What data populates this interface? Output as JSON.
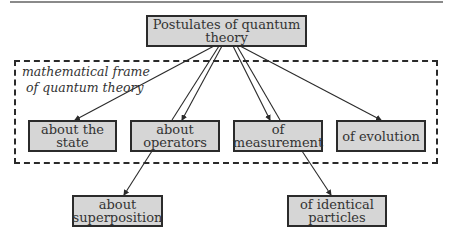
{
  "diagram": {
    "root": {
      "id": "postulates",
      "label": "Postulates of quantum theory"
    },
    "frame": {
      "label_line1": "mathematical frame",
      "label_line2": "of quantum theory",
      "style": "dashed"
    },
    "frame_nodes": [
      {
        "id": "state",
        "label": "about the state"
      },
      {
        "id": "operators",
        "label": "about operators"
      },
      {
        "id": "measurement",
        "label": "of measurement"
      },
      {
        "id": "evolution",
        "label": "of evolution"
      }
    ],
    "outer_nodes": [
      {
        "id": "superposition",
        "label_line1": "about",
        "label_line2": "superposition"
      },
      {
        "id": "identical",
        "label_line1": "of identical",
        "label_line2": "particles"
      }
    ],
    "edges": [
      {
        "from": "postulates",
        "to": "state"
      },
      {
        "from": "postulates",
        "to": "operators"
      },
      {
        "from": "postulates",
        "to": "superposition",
        "via": "operators"
      },
      {
        "from": "postulates",
        "to": "measurement"
      },
      {
        "from": "postulates",
        "to": "identical",
        "via": "measurement"
      },
      {
        "from": "postulates",
        "to": "evolution"
      }
    ],
    "colors": {
      "node_fill": "#d6d6d6",
      "node_border": "#2b2b2b",
      "line": "#2a2a2a"
    }
  }
}
